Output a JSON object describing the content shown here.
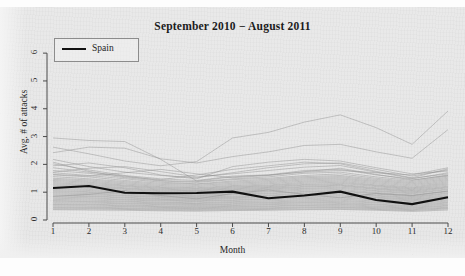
{
  "chart_data": {
    "type": "line",
    "title": "September 2010 − August 2011",
    "xlabel": "Month",
    "ylabel": "Avg. # of attacks",
    "x": [
      1,
      2,
      3,
      4,
      5,
      6,
      7,
      8,
      9,
      10,
      11,
      12
    ],
    "xticklabels": [
      "1",
      "2",
      "3",
      "4",
      "5",
      "6",
      "7",
      "8",
      "9",
      "10",
      "11",
      "12"
    ],
    "yticklabels": [
      "0",
      "1",
      "2",
      "3",
      "4",
      "5",
      "6"
    ],
    "xlim": [
      1,
      12
    ],
    "ylim": [
      0,
      6.4
    ],
    "grid": false,
    "legend_position": "top-left",
    "legend": [
      "Spain"
    ],
    "highlight_color": "#111111",
    "background_color": "#e8e8e8",
    "series": [
      {
        "name": "Spain",
        "highlight": true,
        "values": [
          1.15,
          1.22,
          0.98,
          0.96,
          0.97,
          1.02,
          0.78,
          0.88,
          1.02,
          0.72,
          0.57,
          0.82
        ]
      },
      {
        "name": "country-01",
        "highlight": false,
        "values": [
          2.95,
          2.86,
          2.82,
          2.18,
          1.4,
          1.55,
          1.62,
          1.72,
          1.78,
          1.7,
          1.62,
          1.88
        ]
      },
      {
        "name": "country-02",
        "highlight": false,
        "values": [
          2.42,
          2.62,
          2.58,
          2.2,
          2.05,
          2.28,
          2.45,
          2.68,
          2.72,
          2.45,
          2.22,
          3.25
        ]
      },
      {
        "name": "country-03",
        "highlight": false,
        "values": [
          2.62,
          2.38,
          2.12,
          1.95,
          2.1,
          2.95,
          3.15,
          3.52,
          3.78,
          3.32,
          2.72,
          3.92
        ]
      },
      {
        "name": "country-04",
        "highlight": false,
        "values": [
          2.18,
          1.92,
          1.72,
          1.6,
          1.52,
          1.7,
          1.88,
          2.02,
          2.05,
          1.82,
          1.58,
          1.8
        ]
      },
      {
        "name": "country-05",
        "highlight": false,
        "values": [
          2.02,
          1.8,
          1.6,
          1.48,
          1.42,
          1.58,
          1.62,
          1.78,
          1.82,
          1.62,
          1.48,
          1.7
        ]
      },
      {
        "name": "country-06",
        "highlight": false,
        "values": [
          1.88,
          1.72,
          1.58,
          1.42,
          1.38,
          1.48,
          1.55,
          1.68,
          1.72,
          1.55,
          1.42,
          1.62
        ]
      },
      {
        "name": "country-07",
        "highlight": false,
        "values": [
          1.78,
          1.68,
          1.52,
          1.4,
          1.35,
          1.45,
          1.5,
          1.6,
          1.66,
          1.5,
          1.38,
          1.58
        ]
      },
      {
        "name": "country-08",
        "highlight": false,
        "values": [
          1.7,
          1.6,
          1.48,
          1.36,
          1.3,
          1.4,
          1.46,
          1.56,
          1.6,
          1.46,
          1.34,
          1.54
        ]
      },
      {
        "name": "country-09",
        "highlight": false,
        "values": [
          1.62,
          1.55,
          1.42,
          1.32,
          1.28,
          1.36,
          1.42,
          1.52,
          1.56,
          1.42,
          1.3,
          1.5
        ]
      },
      {
        "name": "country-10",
        "highlight": false,
        "values": [
          1.56,
          1.48,
          1.38,
          1.28,
          1.24,
          1.32,
          1.38,
          1.48,
          1.52,
          1.38,
          1.26,
          1.46
        ]
      },
      {
        "name": "country-11",
        "highlight": false,
        "values": [
          1.5,
          1.44,
          1.34,
          1.24,
          1.2,
          1.28,
          1.34,
          1.44,
          1.48,
          1.34,
          1.22,
          1.42
        ]
      },
      {
        "name": "country-12",
        "highlight": false,
        "values": [
          1.46,
          1.4,
          1.3,
          1.2,
          1.16,
          1.24,
          1.3,
          1.4,
          1.44,
          1.3,
          1.18,
          1.38
        ]
      },
      {
        "name": "country-13",
        "highlight": false,
        "values": [
          1.42,
          1.36,
          1.26,
          1.17,
          1.13,
          1.21,
          1.26,
          1.36,
          1.4,
          1.26,
          1.15,
          1.34
        ]
      },
      {
        "name": "country-14",
        "highlight": false,
        "values": [
          1.38,
          1.32,
          1.23,
          1.14,
          1.1,
          1.18,
          1.23,
          1.32,
          1.36,
          1.23,
          1.12,
          1.3
        ]
      },
      {
        "name": "country-15",
        "highlight": false,
        "values": [
          1.34,
          1.28,
          1.2,
          1.11,
          1.07,
          1.15,
          1.2,
          1.28,
          1.32,
          1.2,
          1.09,
          1.26
        ]
      },
      {
        "name": "country-16",
        "highlight": false,
        "values": [
          1.3,
          1.25,
          1.16,
          1.08,
          1.05,
          1.12,
          1.17,
          1.25,
          1.28,
          1.16,
          1.06,
          1.22
        ]
      },
      {
        "name": "country-17",
        "highlight": false,
        "values": [
          1.26,
          1.21,
          1.13,
          1.05,
          1.02,
          1.09,
          1.14,
          1.21,
          1.25,
          1.13,
          1.03,
          1.19
        ]
      },
      {
        "name": "country-18",
        "highlight": false,
        "values": [
          1.22,
          1.18,
          1.1,
          1.02,
          0.99,
          1.06,
          1.11,
          1.18,
          1.22,
          1.1,
          1.0,
          1.16
        ]
      },
      {
        "name": "country-19",
        "highlight": false,
        "values": [
          1.18,
          1.14,
          1.06,
          0.99,
          0.96,
          1.03,
          1.08,
          1.14,
          1.18,
          1.06,
          0.97,
          1.12
        ]
      },
      {
        "name": "country-20",
        "highlight": false,
        "values": [
          1.14,
          1.1,
          1.03,
          0.96,
          0.93,
          1.0,
          1.04,
          1.11,
          1.14,
          1.03,
          0.94,
          1.09
        ]
      },
      {
        "name": "country-21",
        "highlight": false,
        "values": [
          1.1,
          1.06,
          0.99,
          0.93,
          0.9,
          0.96,
          1.01,
          1.07,
          1.1,
          0.99,
          0.9,
          1.05
        ]
      },
      {
        "name": "country-22",
        "highlight": false,
        "values": [
          1.06,
          1.02,
          0.96,
          0.9,
          0.87,
          0.93,
          0.97,
          1.03,
          1.06,
          0.96,
          0.87,
          1.02
        ]
      },
      {
        "name": "country-23",
        "highlight": false,
        "values": [
          1.02,
          0.99,
          0.93,
          0.87,
          0.84,
          0.9,
          0.94,
          1.0,
          1.03,
          0.93,
          0.84,
          0.98
        ]
      },
      {
        "name": "country-24",
        "highlight": false,
        "values": [
          0.98,
          0.95,
          0.89,
          0.84,
          0.81,
          0.86,
          0.9,
          0.96,
          0.99,
          0.89,
          0.81,
          0.95
        ]
      },
      {
        "name": "country-25",
        "highlight": false,
        "values": [
          0.94,
          0.91,
          0.86,
          0.81,
          0.78,
          0.83,
          0.87,
          0.92,
          0.95,
          0.86,
          0.78,
          0.91
        ]
      },
      {
        "name": "country-26",
        "highlight": false,
        "values": [
          0.9,
          0.87,
          0.82,
          0.77,
          0.75,
          0.8,
          0.83,
          0.88,
          0.91,
          0.82,
          0.75,
          0.87
        ]
      },
      {
        "name": "country-27",
        "highlight": false,
        "values": [
          0.86,
          0.84,
          0.79,
          0.74,
          0.72,
          0.77,
          0.8,
          0.85,
          0.87,
          0.79,
          0.72,
          0.84
        ]
      },
      {
        "name": "country-28",
        "highlight": false,
        "values": [
          0.82,
          0.8,
          0.75,
          0.71,
          0.69,
          0.73,
          0.76,
          0.81,
          0.83,
          0.75,
          0.69,
          0.8
        ]
      },
      {
        "name": "country-29",
        "highlight": false,
        "values": [
          0.78,
          0.76,
          0.72,
          0.68,
          0.66,
          0.7,
          0.73,
          0.77,
          0.79,
          0.72,
          0.66,
          0.76
        ]
      },
      {
        "name": "country-30",
        "highlight": false,
        "values": [
          0.74,
          0.72,
          0.68,
          0.64,
          0.62,
          0.66,
          0.69,
          0.73,
          0.75,
          0.68,
          0.62,
          0.72
        ]
      },
      {
        "name": "country-31",
        "highlight": false,
        "values": [
          0.7,
          0.68,
          0.65,
          0.61,
          0.59,
          0.63,
          0.65,
          0.69,
          0.71,
          0.64,
          0.59,
          0.68
        ]
      },
      {
        "name": "country-32",
        "highlight": false,
        "values": [
          0.66,
          0.65,
          0.61,
          0.58,
          0.56,
          0.59,
          0.62,
          0.65,
          0.67,
          0.61,
          0.56,
          0.64
        ]
      },
      {
        "name": "country-33",
        "highlight": false,
        "values": [
          0.62,
          0.61,
          0.58,
          0.55,
          0.53,
          0.56,
          0.58,
          0.62,
          0.63,
          0.57,
          0.52,
          0.61
        ]
      },
      {
        "name": "country-34",
        "highlight": false,
        "values": [
          0.58,
          0.57,
          0.54,
          0.51,
          0.5,
          0.52,
          0.55,
          0.58,
          0.59,
          0.54,
          0.49,
          0.57
        ]
      },
      {
        "name": "country-35",
        "highlight": false,
        "values": [
          0.55,
          0.54,
          0.51,
          0.48,
          0.47,
          0.49,
          0.51,
          0.54,
          0.56,
          0.5,
          0.46,
          0.53
        ]
      },
      {
        "name": "country-36",
        "highlight": false,
        "values": [
          0.51,
          0.5,
          0.48,
          0.45,
          0.44,
          0.46,
          0.48,
          0.51,
          0.52,
          0.47,
          0.43,
          0.5
        ]
      },
      {
        "name": "country-37",
        "highlight": false,
        "values": [
          0.47,
          0.46,
          0.44,
          0.42,
          0.41,
          0.43,
          0.44,
          0.47,
          0.48,
          0.44,
          0.4,
          0.46
        ]
      },
      {
        "name": "country-38",
        "highlight": false,
        "values": [
          0.44,
          0.43,
          0.41,
          0.39,
          0.38,
          0.4,
          0.41,
          0.44,
          0.45,
          0.41,
          0.37,
          0.43
        ]
      },
      {
        "name": "country-39",
        "highlight": false,
        "values": [
          0.4,
          0.4,
          0.38,
          0.36,
          0.35,
          0.37,
          0.38,
          0.4,
          0.41,
          0.38,
          0.34,
          0.4
        ]
      },
      {
        "name": "country-40",
        "highlight": false,
        "values": [
          0.37,
          0.36,
          0.35,
          0.33,
          0.32,
          0.34,
          0.35,
          0.37,
          0.38,
          0.35,
          0.31,
          0.36
        ]
      },
      {
        "name": "country-41",
        "highlight": false,
        "values": [
          1.95,
          2.05,
          1.88,
          1.62,
          1.48,
          1.92,
          2.08,
          2.18,
          2.12,
          1.88,
          1.66,
          1.76
        ]
      },
      {
        "name": "country-42",
        "highlight": false,
        "values": [
          2.08,
          1.75,
          1.55,
          1.45,
          1.62,
          1.82,
          1.95,
          2.08,
          2.02,
          1.75,
          1.52,
          1.84
        ]
      },
      {
        "name": "country-43",
        "highlight": false,
        "values": [
          1.72,
          1.86,
          1.92,
          1.74,
          1.55,
          1.66,
          1.78,
          1.9,
          1.96,
          1.72,
          1.5,
          1.66
        ]
      },
      {
        "name": "country-44",
        "highlight": false,
        "values": [
          1.64,
          1.58,
          1.7,
          1.82,
          1.66,
          1.52,
          1.6,
          1.74,
          1.86,
          1.64,
          1.44,
          1.6
        ]
      },
      {
        "name": "country-45",
        "highlight": false,
        "values": [
          0.85,
          0.92,
          1.05,
          0.88,
          0.76,
          0.95,
          1.08,
          0.92,
          0.8,
          0.95,
          0.88,
          1.04
        ]
      }
    ]
  }
}
